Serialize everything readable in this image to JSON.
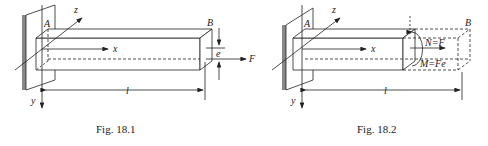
{
  "figures": [
    {
      "caption": "Fig. 18.1",
      "labels": {
        "A": "A",
        "B": "B",
        "z": "z",
        "x": "x",
        "y": "y",
        "l": "l",
        "e": "e",
        "F": "F"
      }
    },
    {
      "caption": "Fig. 18.2",
      "labels": {
        "A": "A",
        "B": "B",
        "z": "z",
        "x": "x",
        "y": "y",
        "l": "l",
        "N": "N=F",
        "M": "M=Fe"
      }
    }
  ]
}
